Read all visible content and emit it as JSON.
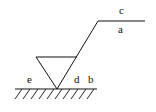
{
  "diagram": {
    "type": "surface-roughness-symbol",
    "stroke_color": "#111111",
    "background": "#ffffff",
    "labels": {
      "c": "c",
      "a": "a",
      "e": "e",
      "d": "d",
      "b": "b"
    }
  }
}
